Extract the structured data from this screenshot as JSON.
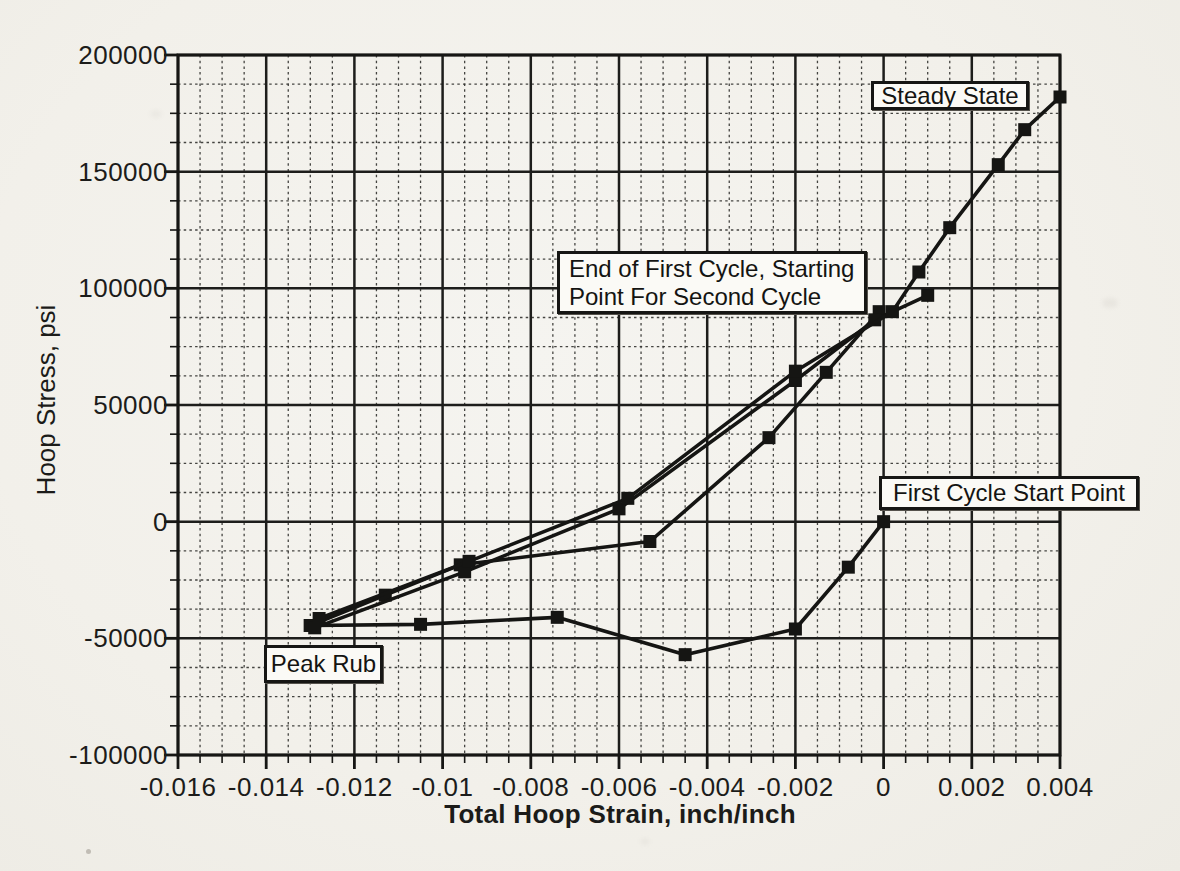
{
  "page": {
    "paper_color": "#f2f0ea",
    "ink_color": "#1a1a18"
  },
  "chart_data": {
    "type": "line",
    "title": "",
    "xlabel": "Total Hoop Strain, inch/inch",
    "ylabel": "Hoop Stress, psi",
    "xlim": [
      -0.016,
      0.004
    ],
    "ylim": [
      -100000,
      200000
    ],
    "x_major_step": 0.002,
    "x_minor_step": 0.0005,
    "y_major_step": 50000,
    "y_minor_step": 12500,
    "grid": "major-solid, minor-dashed, full graph-paper style",
    "legend_position": "none",
    "x_tick_values": [
      -0.016,
      -0.014,
      -0.012,
      -0.01,
      -0.008,
      -0.006,
      -0.004,
      -0.002,
      0,
      0.002,
      0.004
    ],
    "x_tick_labels": [
      "-0.016",
      "-0.014",
      "-0.012",
      "-0.01",
      "-0.008",
      "-0.006",
      "-0.004",
      "-0.002",
      "0",
      "0.002",
      "0.004"
    ],
    "y_tick_values": [
      200000,
      150000,
      100000,
      50000,
      0,
      -50000,
      -100000
    ],
    "y_tick_labels": [
      "200000",
      "150000",
      "100000",
      "50000",
      "0",
      "-50000",
      "-100000"
    ],
    "marker": "filled-black-square",
    "line_color": "#151513",
    "series": [
      {
        "name": "first-cycle-unloading-to-peak-rub",
        "points": [
          [
            0,
            0
          ],
          [
            -0.0008,
            -19500
          ],
          [
            -0.002,
            -46000
          ],
          [
            -0.0045,
            -57000
          ],
          [
            -0.0074,
            -41000
          ],
          [
            -0.0105,
            -44000
          ],
          [
            -0.013,
            -44500
          ]
        ]
      },
      {
        "name": "first-cycle-reloading-to-end-of-cycle",
        "points": [
          [
            -0.013,
            -44500
          ],
          [
            -0.0113,
            -31500
          ],
          [
            -0.0096,
            -18500
          ],
          [
            -0.0053,
            -8500
          ],
          [
            -0.0026,
            36000
          ],
          [
            -0.0013,
            64000
          ],
          [
            -0.0001,
            90000
          ]
        ]
      },
      {
        "name": "second-cycle-unloading",
        "points": [
          [
            0.001,
            97000
          ],
          [
            -0.0002,
            86500
          ],
          [
            -0.002,
            60500
          ],
          [
            -0.006,
            5500
          ],
          [
            -0.0095,
            -21500
          ],
          [
            -0.0129,
            -45500
          ]
        ]
      },
      {
        "name": "steady-state-cycle-loading",
        "points": [
          [
            -0.0128,
            -41500
          ],
          [
            -0.0094,
            -17000
          ],
          [
            -0.0058,
            10000
          ],
          [
            -0.002,
            64500
          ],
          [
            0.0002,
            90000
          ],
          [
            0.0008,
            107000
          ],
          [
            0.0015,
            126000
          ],
          [
            0.0026,
            153000
          ],
          [
            0.0032,
            168000
          ],
          [
            0.004,
            182000
          ]
        ]
      }
    ],
    "annotations": [
      {
        "id": "steady-state",
        "text": "Steady State",
        "align": "center",
        "anchor_data_point": [
          0.004,
          182000
        ],
        "box": {
          "left": 871,
          "top": 81,
          "width": 158,
          "height": 29
        }
      },
      {
        "id": "end-of-first-cycle",
        "text": "End of First Cycle, Starting\nPoint For Second Cycle",
        "align": "left",
        "anchor_data_point": [
          -0.0001,
          90000
        ],
        "box": {
          "left": 557,
          "top": 251,
          "width": 310,
          "height": 63
        }
      },
      {
        "id": "first-cycle-start-point",
        "text": "First Cycle Start Point",
        "align": "center",
        "anchor_data_point": [
          0,
          0
        ],
        "box": {
          "left": 879,
          "top": 476,
          "width": 260,
          "height": 34
        }
      },
      {
        "id": "peak-rub",
        "text": "Peak Rub",
        "align": "center",
        "anchor_data_point": [
          -0.013,
          -44500
        ],
        "box": {
          "left": 264,
          "top": 645,
          "width": 119,
          "height": 38
        }
      }
    ]
  }
}
